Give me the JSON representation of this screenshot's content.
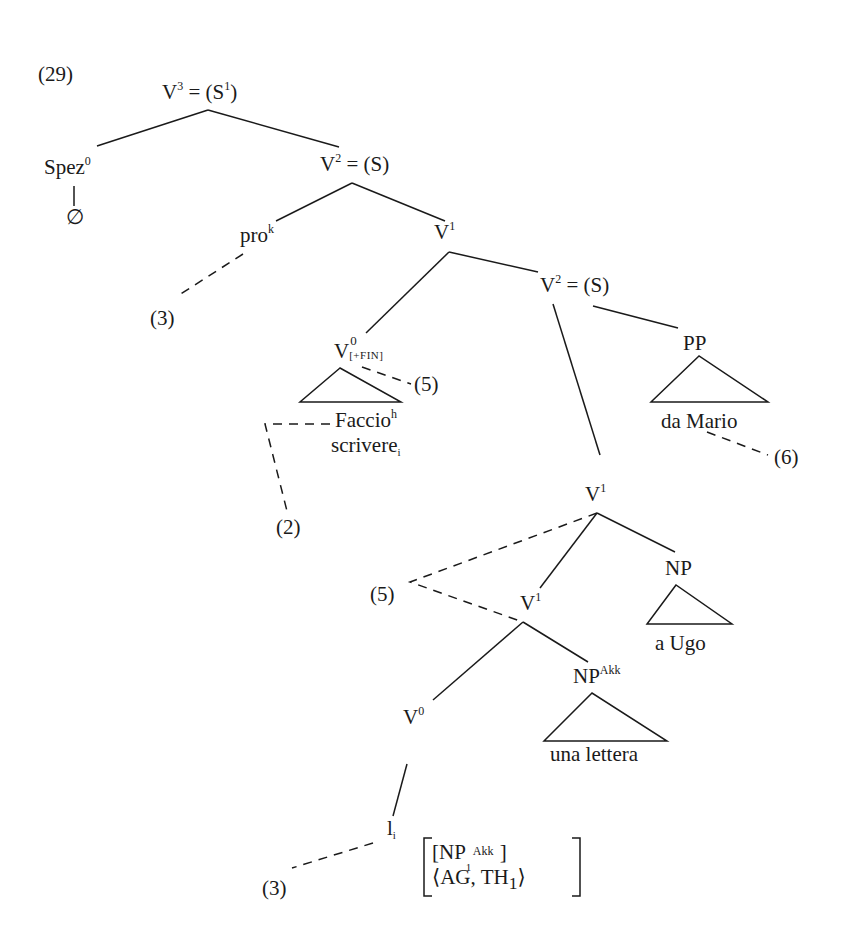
{
  "example_number": "(29)",
  "nodes": {
    "v3": {
      "base": "V",
      "sup": "3",
      "rest": " = (S",
      "rest_sup": "1",
      "close": ")"
    },
    "spez": {
      "base": "Spez",
      "sup": "0"
    },
    "empty": "∅",
    "v2_top": {
      "base": "V",
      "sup": "2",
      "rest": " = (S)"
    },
    "pro": {
      "base": "pro",
      "sup": "k"
    },
    "v1_top": {
      "base": "V",
      "sup": "1"
    },
    "v0_fin": {
      "base": "V",
      "sup": "0",
      "sub": "[+FIN]"
    },
    "faccio": {
      "base": "Faccio",
      "sup": "h"
    },
    "scrivere": {
      "base": "scrivere",
      "sub": "i"
    },
    "v2_mid": {
      "base": "V",
      "sup": "2",
      "rest": " = (S)"
    },
    "pp": "PP",
    "da_mario": "da Mario",
    "v1_mid": {
      "base": "V",
      "sup": "1"
    },
    "np": "NP",
    "a_ugo": "a Ugo",
    "v1_low": {
      "base": "V",
      "sup": "1"
    },
    "np_akk": {
      "base": "NP",
      "sup": "Akk"
    },
    "una_lettera": "una lettera",
    "v0_low": {
      "base": "V",
      "sup": "0"
    },
    "li": {
      "base": "l",
      "sub": "i"
    },
    "features": {
      "row1": {
        "open": "[NP",
        "sub": "1",
        "sup": "Akk",
        "close": "]"
      },
      "row2": {
        "open": "⟨AG, TH",
        "sub": "1",
        "close": "⟩"
      }
    }
  },
  "annotations": {
    "pro_ref": "(3)",
    "v0fin_ref": "(5)",
    "faccio_ref": "(2)",
    "pp_ref": "(6)",
    "v1_ref": "(5)",
    "li_ref": "(3)"
  }
}
